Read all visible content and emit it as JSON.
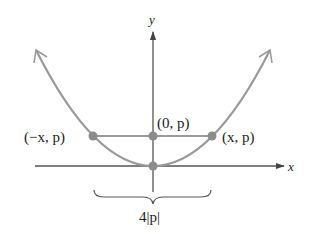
{
  "figure": {
    "axes": {
      "x_label": "x",
      "y_label": "y"
    },
    "points": [
      {
        "label": "(−x, p)",
        "role": "latus-rectum-left"
      },
      {
        "label": "(0, p)",
        "role": "focus"
      },
      {
        "label": "(x, p)",
        "role": "latus-rectum-right"
      },
      {
        "label": "",
        "role": "vertex"
      }
    ],
    "brace_label": "4|p|",
    "colors": {
      "curve": "#9a9a9a",
      "axis": "#555555",
      "point": "#8c8c8c",
      "text": "#222222"
    }
  }
}
